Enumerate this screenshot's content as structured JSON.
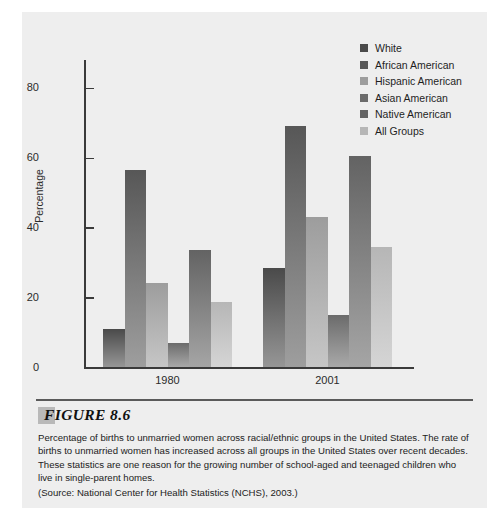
{
  "figure": {
    "number_label": "FIGURE 8.6",
    "caption": "Percentage of births to unmarried women across racial/ethnic groups in the United States. The rate of births to unmarried women has increased across all groups in the United States over recent decades. These statistics are one reason for the growing number of school-aged and teenaged children who live in single-parent homes.",
    "source": "(Source: National Center for Health Statistics (NCHS), 2003.)"
  },
  "legend": {
    "position": "top-right",
    "entries": [
      {
        "label": "White",
        "color": "#4a4a4a"
      },
      {
        "label": "African American",
        "color": "#575757"
      },
      {
        "label": "Hispanic American",
        "color": "#9d9d9d"
      },
      {
        "label": "Asian American",
        "color": "#6b6b6b"
      },
      {
        "label": "Native American",
        "color": "#636363"
      },
      {
        "label": "All Groups",
        "color": "#b6b6b6"
      }
    ]
  },
  "chart_data": {
    "type": "bar",
    "title": "",
    "xlabel": "",
    "ylabel": "Percentage",
    "categories": [
      "1980",
      "2001"
    ],
    "ylim": [
      0,
      88
    ],
    "yticks": [
      0,
      20,
      40,
      60,
      80
    ],
    "ytick_labels": [
      "0",
      "20",
      "40",
      "60",
      "80"
    ],
    "grid": false,
    "series": [
      {
        "name": "White",
        "color": "#4a4a4a",
        "values": [
          11.0,
          28.5
        ]
      },
      {
        "name": "African American",
        "color": "#575757",
        "values": [
          56.5,
          69.0
        ]
      },
      {
        "name": "Hispanic American",
        "color": "#9d9d9d",
        "values": [
          24.0,
          43.0
        ]
      },
      {
        "name": "Asian American",
        "color": "#6b6b6b",
        "values": [
          7.0,
          15.0
        ]
      },
      {
        "name": "Native American",
        "color": "#636363",
        "values": [
          33.5,
          60.5
        ]
      },
      {
        "name": "All Groups",
        "color": "#b6b6b6",
        "values": [
          18.5,
          34.5
        ]
      }
    ]
  }
}
